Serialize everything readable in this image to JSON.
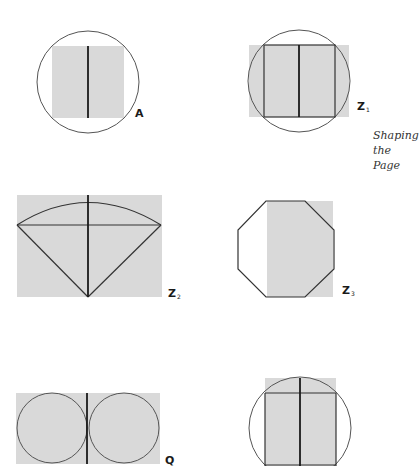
{
  "caption": {
    "lines": [
      "Shaping",
      "the",
      "Page"
    ]
  },
  "figures": [
    {
      "id": "A",
      "label": "A",
      "subscript": "",
      "description": "Square page centered in a circle with a vertical fold line"
    },
    {
      "id": "Z1",
      "label": "Z",
      "subscript": "1",
      "description": "Wide rectangle behind a circle; inscribed rectangle split by center line"
    },
    {
      "id": "Z2",
      "label": "Z",
      "subscript": "2",
      "description": "Rectangle containing a circular sector (kite with arc top) and crossing lines"
    },
    {
      "id": "Z3",
      "label": "Z",
      "subscript": "3",
      "description": "Octagon outline with shaded rectangle on its right side"
    },
    {
      "id": "Q",
      "label": "Q",
      "subscript": "",
      "description": "Rectangle containing two tangent circles with a vertical center line"
    },
    {
      "id": "Z4",
      "label": "",
      "subscript": "",
      "description": "Tall rectangle inscribed in circle with horizontal and vertical division lines"
    }
  ],
  "colors": {
    "page_fill": "#d9d9d9",
    "line": "#1a1a1a",
    "circle": "#555555",
    "background": "#ffffff"
  }
}
